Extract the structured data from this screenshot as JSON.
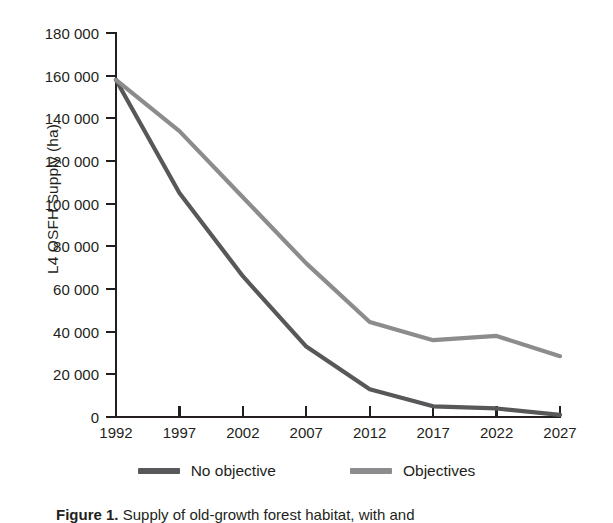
{
  "chart_data": {
    "type": "line",
    "title": "",
    "xlabel": "",
    "ylabel": "L4 OSFH Supply (ha)",
    "categories": [
      "1992",
      "1997",
      "2002",
      "2007",
      "2012",
      "2017",
      "2022",
      "2027"
    ],
    "x": [
      1992,
      1997,
      2002,
      2007,
      2012,
      2017,
      2022,
      2027
    ],
    "xlim": [
      1992,
      2027
    ],
    "ylim": [
      0,
      180000
    ],
    "ytick_values": [
      0,
      20000,
      40000,
      60000,
      80000,
      100000,
      120000,
      140000,
      160000,
      180000
    ],
    "ytick_labels": [
      "0",
      "20 000",
      "40 000",
      "60 000",
      "80 000",
      "100 000",
      "120 000",
      "140 000",
      "160 000",
      "180 000"
    ],
    "grid": false,
    "legend_position": "bottom",
    "series": [
      {
        "name": "No objective",
        "color": "#58585a",
        "values": [
          158000,
          105000,
          66000,
          33000,
          13000,
          5000,
          4000,
          1000
        ]
      },
      {
        "name": "Objectives",
        "color": "#8c8c8e",
        "values": [
          158000,
          134000,
          103000,
          72000,
          44500,
          36000,
          38000,
          28500
        ]
      }
    ]
  },
  "axis": {
    "y_title": "L4 OSFH Supply (ha)"
  },
  "legend": {
    "items": [
      {
        "label": "No objective",
        "color": "#58585a"
      },
      {
        "label": "Objectives",
        "color": "#8c8c8e"
      }
    ]
  },
  "caption": {
    "figure_label": "Figure 1.",
    "text": "Supply of old-growth forest habitat, with and"
  }
}
